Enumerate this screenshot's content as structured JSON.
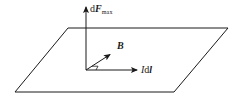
{
  "diagram": {
    "type": "vector-diagram",
    "plane": {
      "shape": "parallelogram",
      "corners": [
        [
          68,
          28
        ],
        [
          228,
          28
        ],
        [
          174,
          92
        ],
        [
          15,
          92
        ]
      ]
    },
    "origin": [
      86,
      70
    ],
    "vectors": [
      {
        "id": "dF_max",
        "direction": "up (perpendicular to plane)",
        "from": [
          86,
          70
        ],
        "to": [
          86,
          6
        ],
        "label": {
          "prefix": "d",
          "main": "F",
          "subscript": "max"
        }
      },
      {
        "id": "B",
        "direction": "into plane, diagonal",
        "from": [
          86,
          70
        ],
        "to": [
          111,
          54
        ],
        "label": {
          "main": "B"
        }
      },
      {
        "id": "Idl",
        "direction": "right, in plane",
        "from": [
          86,
          70
        ],
        "to": [
          138,
          70
        ],
        "label": {
          "prefix": "I",
          "middle": "d",
          "main": "l"
        }
      }
    ],
    "right_angle_marker": {
      "between": [
        "B",
        "Idl"
      ],
      "at": [
        86,
        70
      ]
    },
    "colors": {
      "stroke": "#1a1a1a",
      "background": "#ffffff"
    }
  }
}
